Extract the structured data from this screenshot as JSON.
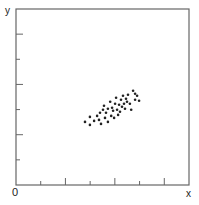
{
  "chart_data": {
    "type": "scatter",
    "title": "",
    "xlabel": "x",
    "ylabel": "y",
    "origin_label": "0",
    "xlim": [
      0,
      7
    ],
    "ylim": [
      0,
      7
    ],
    "x_ticks": [
      1,
      2,
      3,
      4,
      5,
      6
    ],
    "y_ticks": [
      1,
      2,
      3,
      4,
      5,
      6
    ],
    "tick_labels_shown": false,
    "grid": false,
    "legend": null,
    "frame": "box",
    "point_color": "#222222",
    "axis_color": "#666666",
    "series": [
      {
        "name": "points",
        "points": [
          [
            2.79,
            2.51
          ],
          [
            2.99,
            2.71
          ],
          [
            2.99,
            2.39
          ],
          [
            3.36,
            2.59
          ],
          [
            3.4,
            2.87
          ],
          [
            3.44,
            2.43
          ],
          [
            3.56,
            3.15
          ],
          [
            3.6,
            2.67
          ],
          [
            3.64,
            2.87
          ],
          [
            3.72,
            3.03
          ],
          [
            3.72,
            2.51
          ],
          [
            3.81,
            3.31
          ],
          [
            3.85,
            2.75
          ],
          [
            3.89,
            3.07
          ],
          [
            3.93,
            2.95
          ],
          [
            3.97,
            2.67
          ],
          [
            4.01,
            3.23
          ],
          [
            4.05,
            3.47
          ],
          [
            4.09,
            2.99
          ],
          [
            4.13,
            2.79
          ],
          [
            4.17,
            3.19
          ],
          [
            4.21,
            2.91
          ],
          [
            4.25,
            3.39
          ],
          [
            4.29,
            3.11
          ],
          [
            4.33,
            3.55
          ],
          [
            4.37,
            3.23
          ],
          [
            4.41,
            3.03
          ],
          [
            4.45,
            3.43
          ],
          [
            4.49,
            3.31
          ],
          [
            4.53,
            3.59
          ],
          [
            4.61,
            3.23
          ],
          [
            4.74,
            3.75
          ],
          [
            4.82,
            3.63
          ],
          [
            4.82,
            3.39
          ],
          [
            4.9,
            3.55
          ],
          [
            4.98,
            3.35
          ],
          [
            4.66,
            2.99
          ],
          [
            3.52,
            2.99
          ],
          [
            3.16,
            2.55
          ],
          [
            3.28,
            2.75
          ]
        ]
      }
    ]
  }
}
